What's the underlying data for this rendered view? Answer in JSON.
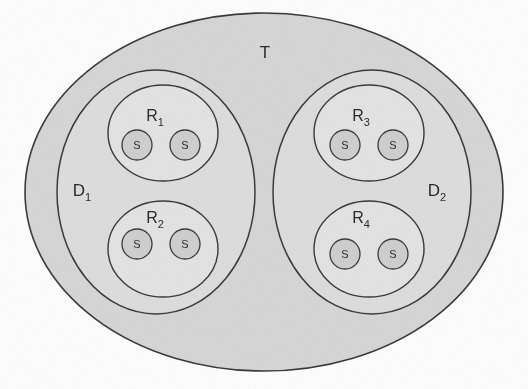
{
  "diagram": {
    "title_label": "T",
    "type": "nested-set-diagram",
    "background_color": "#fdfdfd",
    "stroke_color": "#3a3a3a",
    "universe": {
      "label": "T",
      "shape": "ellipse",
      "fill_color": "#d6d6d6",
      "cx": 264,
      "cy": 192,
      "rx": 239,
      "ry": 179
    },
    "domains": [
      {
        "label": "D",
        "subscript": "1",
        "full_label": "D1",
        "shape": "ellipse",
        "fill_color": "#dddddd",
        "cx": 156,
        "cy": 192,
        "rx": 99,
        "ry": 122,
        "label_x": 82,
        "label_y": 196
      },
      {
        "label": "D",
        "subscript": "2",
        "full_label": "D2",
        "shape": "ellipse",
        "fill_color": "#dddddd",
        "cx": 372,
        "cy": 192,
        "rx": 99,
        "ry": 122,
        "label_x": 437,
        "label_y": 196
      }
    ],
    "regions": [
      {
        "label": "R",
        "subscript": "1",
        "full_label": "R1",
        "parent": "D1",
        "shape": "ellipse",
        "fill_color": "#e3e3e3",
        "cx": 163,
        "cy": 133,
        "rx": 55,
        "ry": 48,
        "label_x": 155,
        "label_y": 121
      },
      {
        "label": "R",
        "subscript": "2",
        "full_label": "R2",
        "parent": "D1",
        "shape": "ellipse",
        "fill_color": "#e3e3e3",
        "cx": 163,
        "cy": 249,
        "rx": 55,
        "ry": 48,
        "label_x": 155,
        "label_y": 223
      },
      {
        "label": "R",
        "subscript": "3",
        "full_label": "R3",
        "parent": "D2",
        "shape": "ellipse",
        "fill_color": "#e3e3e3",
        "cx": 369,
        "cy": 133,
        "rx": 55,
        "ry": 48,
        "label_x": 361,
        "label_y": 121
      },
      {
        "label": "R",
        "subscript": "4",
        "full_label": "R4",
        "parent": "D2",
        "shape": "ellipse",
        "fill_color": "#e3e3e3",
        "cx": 369,
        "cy": 249,
        "rx": 55,
        "ry": 48,
        "label_x": 361,
        "label_y": 223
      }
    ],
    "atoms": [
      {
        "label": "S",
        "parent": "R1",
        "cx": 137,
        "cy": 145,
        "r": 15,
        "fill_color": "#cfcfcf"
      },
      {
        "label": "S",
        "parent": "R1",
        "cx": 185,
        "cy": 145,
        "r": 15,
        "fill_color": "#cfcfcf"
      },
      {
        "label": "S",
        "parent": "R2",
        "cx": 137,
        "cy": 244,
        "r": 15,
        "fill_color": "#cfcfcf"
      },
      {
        "label": "S",
        "parent": "R2",
        "cx": 185,
        "cy": 244,
        "r": 15,
        "fill_color": "#cfcfcf"
      },
      {
        "label": "S",
        "parent": "R3",
        "cx": 345,
        "cy": 145,
        "r": 15,
        "fill_color": "#cfcfcf"
      },
      {
        "label": "S",
        "parent": "R3",
        "cx": 393,
        "cy": 145,
        "r": 15,
        "fill_color": "#cfcfcf"
      },
      {
        "label": "S",
        "parent": "R4",
        "cx": 345,
        "cy": 254,
        "r": 15,
        "fill_color": "#cfcfcf"
      },
      {
        "label": "S",
        "parent": "R4",
        "cx": 393,
        "cy": 254,
        "r": 15,
        "fill_color": "#cfcfcf"
      }
    ],
    "universe_label_x": 265,
    "universe_label_y": 58
  }
}
